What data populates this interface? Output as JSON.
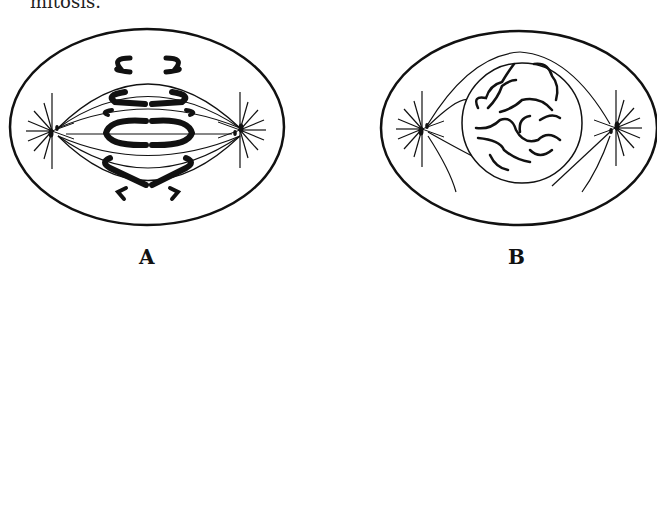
{
  "caption": "mitosis.",
  "cells": [
    {
      "id": "A",
      "label": "A",
      "stage": "anaphase (early)",
      "position": "top-left"
    },
    {
      "id": "B",
      "label": "B",
      "stage": "prophase",
      "position": "top-right"
    },
    {
      "id": "C",
      "label": "",
      "stage": "telophase",
      "position": "bottom-left"
    },
    {
      "id": "D",
      "label": "",
      "stage": "metaphase",
      "position": "bottom-right"
    }
  ],
  "colors": {
    "ink": "#111111",
    "background": "#ffffff"
  }
}
